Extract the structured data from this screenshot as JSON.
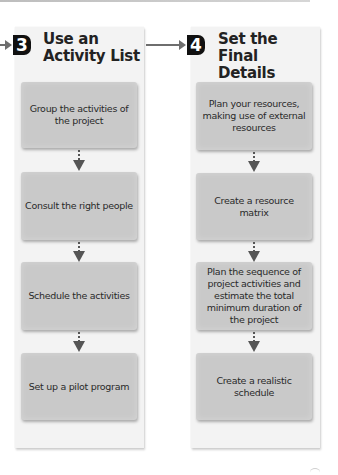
{
  "columns": [
    {
      "step_number": "3",
      "title": "Use an Activity List",
      "steps": [
        "Group the activities of the project",
        "Consult the right people",
        "Schedule the activities",
        "Set up a pilot program"
      ]
    },
    {
      "step_number": "4",
      "title": "Set the Final Details",
      "steps": [
        "Plan your resources, making use of external resources",
        "Create a resource matrix",
        "Plan the sequence of project activities and estimate the total minimum duration of the project",
        "Create a realistic schedule"
      ]
    }
  ],
  "colors": {
    "panel": "#f3f3f3",
    "step_box": "#c9c9c9",
    "badge": "#111111",
    "arrow": "#6e6e6e"
  }
}
